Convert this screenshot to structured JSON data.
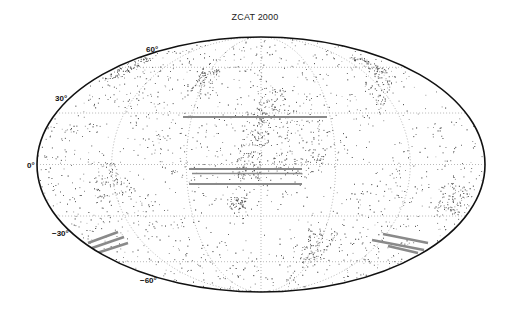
{
  "chart_data": {
    "type": "scatter",
    "projection": "mollweide",
    "title": "ZCAT 2000",
    "xlabel": "",
    "ylabel": "",
    "latitude_tick_labels": [
      "60°",
      "30°",
      "0°",
      "−30°",
      "−60°"
    ],
    "latitude_ticks": [
      60,
      30,
      0,
      -30,
      -60
    ],
    "longitude_gridlines": [
      -120,
      -60,
      0,
      60,
      120
    ],
    "grid": true,
    "grid_style": "dotted",
    "legend": null,
    "series": [
      {
        "name": "galaxies",
        "description": "dense scatter of galaxy positions (all-sky)",
        "color": "#333333"
      },
      {
        "name": "survey-stripes",
        "description": "horizontal survey strips, grey",
        "color": "#888888"
      }
    ],
    "annotations": [
      {
        "type": "stripe",
        "lat_approx": 38,
        "lon_range_approx": [
          -55,
          45
        ]
      },
      {
        "type": "stripe",
        "lat_approx": -4,
        "lon_range_approx": [
          -50,
          30
        ]
      },
      {
        "type": "stripe",
        "lat_approx": -7,
        "lon_range_approx": [
          -50,
          30
        ]
      },
      {
        "type": "stripe",
        "lat_approx": -15,
        "lon_range_approx": [
          -50,
          30
        ]
      },
      {
        "type": "stripe-group",
        "lat_approx": -45,
        "lon_range_approx": [
          -170,
          -140
        ]
      },
      {
        "type": "stripe-group",
        "lat_approx": -45,
        "lon_range_approx": [
          140,
          170
        ]
      }
    ]
  },
  "colors": {
    "border": "#111111",
    "points": "#444444",
    "stripes": "#8a8a8a",
    "grid": "#9a9a9a",
    "background": "#ffffff"
  }
}
